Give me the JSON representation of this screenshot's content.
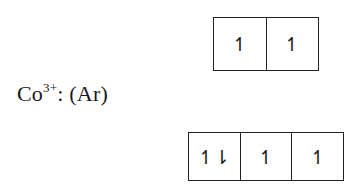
{
  "diagram": {
    "type": "orbital-box-diagram",
    "label": {
      "species": "Co",
      "charge": "3+",
      "suffix": ": (Ar)"
    },
    "orbitals": {
      "top_row": [
        {
          "electrons": "↿"
        },
        {
          "electrons": "↿"
        }
      ],
      "bottom_row": [
        {
          "electrons": "↿⇂"
        },
        {
          "electrons": "↿"
        },
        {
          "electrons": "↿"
        }
      ]
    }
  }
}
